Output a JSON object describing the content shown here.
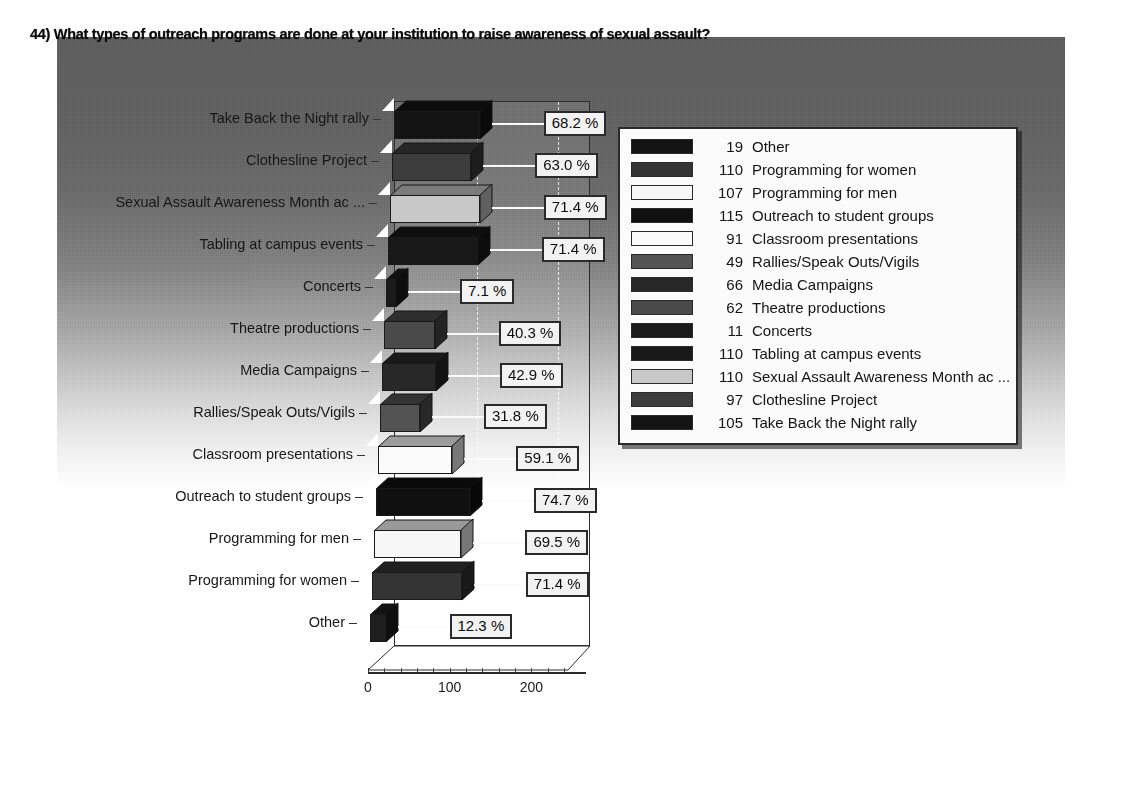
{
  "chart_data": {
    "type": "bar",
    "title": "44) What types of outreach programs are done at your institution to raise awareness of sexual assault?",
    "orientation": "horizontal",
    "xlabel": "",
    "ylabel": "",
    "xlim": [
      0,
      240
    ],
    "xticks": [
      0,
      100,
      200
    ],
    "xtick_labels": [
      "0",
      "100",
      "200"
    ],
    "grid": true,
    "grid_style": "dashed-vertical",
    "legend_position": "right",
    "categories": [
      "Take Back the Night rally",
      "Clothesline Project",
      "Sexual Assault Awareness Month ac ...",
      "Tabling at campus events",
      "Concerts",
      "Theatre productions",
      "Media Campaigns",
      "Rallies/Speak Outs/Vigils",
      "Classroom presentations",
      "Outreach to student groups",
      "Programming for men",
      "Programming for women",
      "Other"
    ],
    "values": [
      105,
      97,
      110,
      110,
      11,
      62,
      66,
      49,
      91,
      115,
      107,
      110,
      19
    ],
    "data_labels": [
      "68.2 %",
      "63.0 %",
      "71.4 %",
      "71.4 %",
      "7.1 %",
      "40.3 %",
      "42.9 %",
      "31.8 %",
      "59.1 %",
      "74.7 %",
      "69.5 %",
      "71.4 %",
      "12.3 %"
    ],
    "bar_colors": [
      "#141414",
      "#3d3d3d",
      "#c8c8c8",
      "#181818",
      "#1b1b1b",
      "#4a4a4a",
      "#282828",
      "#535353",
      "#fbfbfb",
      "#101010",
      "#f7f7f7",
      "#343434",
      "#1e1e1e"
    ]
  },
  "legend": {
    "items": [
      {
        "count": "19",
        "label": "Other",
        "color": "#141414"
      },
      {
        "count": "110",
        "label": "Programming for women",
        "color": "#343434"
      },
      {
        "count": "107",
        "label": "Programming for men",
        "color": "#f7f7f7"
      },
      {
        "count": "115",
        "label": "Outreach to student groups",
        "color": "#101010"
      },
      {
        "count": "91",
        "label": "Classroom presentations",
        "color": "#fbfbfb"
      },
      {
        "count": "49",
        "label": "Rallies/Speak Outs/Vigils",
        "color": "#535353"
      },
      {
        "count": "66",
        "label": "Media Campaigns",
        "color": "#282828"
      },
      {
        "count": "62",
        "label": "Theatre productions",
        "color": "#4a4a4a"
      },
      {
        "count": "11",
        "label": "Concerts",
        "color": "#1b1b1b"
      },
      {
        "count": "110",
        "label": "Tabling at campus events",
        "color": "#181818"
      },
      {
        "count": "110",
        "label": "Sexual Assault Awareness Month ac ...",
        "color": "#c8c8c8"
      },
      {
        "count": "97",
        "label": "Clothesline Project",
        "color": "#3d3d3d"
      },
      {
        "count": "105",
        "label": "Take Back the Night rally",
        "color": "#141414"
      }
    ]
  },
  "colors": {
    "panel_top": "#5e5e5e",
    "panel_bottom": "#fdfdfd",
    "axis": "#2b2b2b",
    "label_box_bg": "#f2f2f2",
    "label_box_border": "#2a2a2a"
  }
}
